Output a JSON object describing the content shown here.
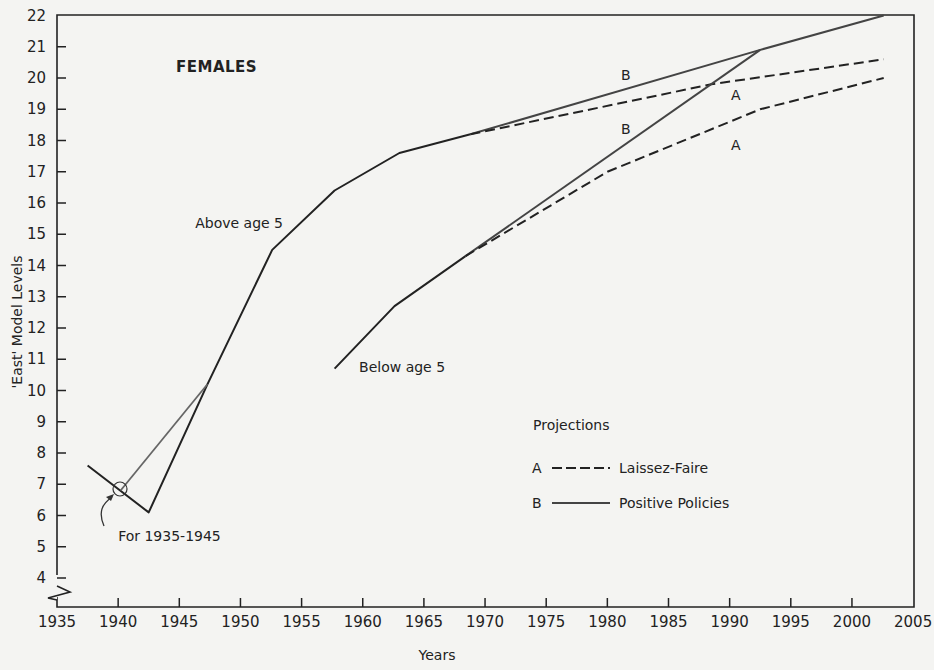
{
  "chart_data": {
    "type": "line",
    "title": "FEMALES",
    "xlabel": "Years",
    "ylabel": "'East' Model Levels",
    "xlim": [
      1935,
      2005
    ],
    "ylim": [
      4,
      22
    ],
    "y_axis_break": true,
    "grid": false,
    "x_ticks": [
      1935,
      1940,
      1945,
      1950,
      1955,
      1960,
      1965,
      1970,
      1975,
      1980,
      1985,
      1990,
      1995,
      2000,
      2005
    ],
    "y_ticks": [
      4,
      5,
      6,
      7,
      8,
      9,
      10,
      11,
      12,
      13,
      14,
      15,
      16,
      17,
      18,
      19,
      20,
      21,
      22
    ],
    "series": [
      {
        "name": "Above age 5 (historical)",
        "style": "solid",
        "points": [
          [
            1937.5,
            7.6
          ],
          [
            1942.5,
            6.1
          ],
          [
            1947.3,
            10.2
          ],
          [
            1952.6,
            14.5
          ],
          [
            1957.7,
            16.4
          ],
          [
            1963.0,
            17.6
          ],
          [
            1968.8,
            18.2
          ]
        ]
      },
      {
        "name": "For 1935-1945 (alternate estimate)",
        "style": "solid-gray",
        "points": [
          [
            1940.2,
            6.8
          ],
          [
            1947.3,
            10.2
          ]
        ]
      },
      {
        "name": "Above age 5 — B Positive Policies",
        "style": "solid",
        "points": [
          [
            1968.8,
            18.2
          ],
          [
            1992.5,
            20.9
          ],
          [
            2002.6,
            22.0
          ]
        ]
      },
      {
        "name": "Above age 5 — A Laissez-Faire",
        "style": "dashed",
        "points": [
          [
            1968.8,
            18.2
          ],
          [
            1988.5,
            19.8
          ],
          [
            2002.6,
            20.6
          ]
        ]
      },
      {
        "name": "Below age 5 (historical)",
        "style": "solid",
        "points": [
          [
            1957.7,
            10.7
          ],
          [
            1962.6,
            12.7
          ],
          [
            1968.4,
            14.3
          ]
        ]
      },
      {
        "name": "Below age 5 — B Positive Policies",
        "style": "solid",
        "points": [
          [
            1968.4,
            14.3
          ],
          [
            1992.5,
            20.9
          ]
        ]
      },
      {
        "name": "Below age 5 — A Laissez-Faire",
        "style": "dashed",
        "points": [
          [
            1968.4,
            14.3
          ],
          [
            1980.0,
            17.0
          ],
          [
            1992.5,
            19.0
          ],
          [
            2002.6,
            20.0
          ]
        ]
      }
    ],
    "series_labels": [
      {
        "text": "B",
        "x": 1981.5,
        "y": 19.95
      },
      {
        "text": "A",
        "x": 1990.5,
        "y": 19.3
      },
      {
        "text": "B",
        "x": 1981.5,
        "y": 18.2
      },
      {
        "text": "A",
        "x": 1990.5,
        "y": 17.7
      }
    ],
    "annotations": [
      {
        "text": "Above age 5",
        "x": 1946.3,
        "y": 15.2
      },
      {
        "text": "Below age 5",
        "x": 1959.7,
        "y": 10.6
      },
      {
        "text": "For 1935-1945",
        "x": 1940.0,
        "y": 5.2
      }
    ],
    "legend": {
      "title": "Projections",
      "position": "center-right",
      "entries": [
        {
          "key": "A",
          "style": "dashed",
          "label": "Laissez-Faire"
        },
        {
          "key": "B",
          "style": "solid",
          "label": "Positive Policies"
        }
      ]
    }
  }
}
